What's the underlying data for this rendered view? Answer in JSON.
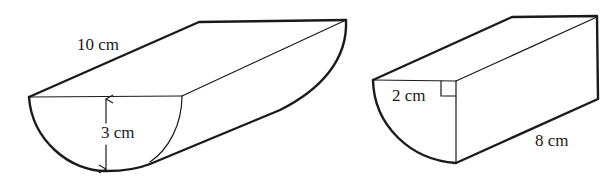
{
  "figures": [
    {
      "name": "half-cylinder",
      "labels": {
        "length": "10 cm",
        "radius": "3 cm"
      }
    },
    {
      "name": "quarter-cylinder",
      "labels": {
        "radius": "2 cm",
        "length": "8 cm"
      }
    }
  ],
  "colors": {
    "stroke": "#1a1a1a",
    "background": "#ffffff"
  }
}
